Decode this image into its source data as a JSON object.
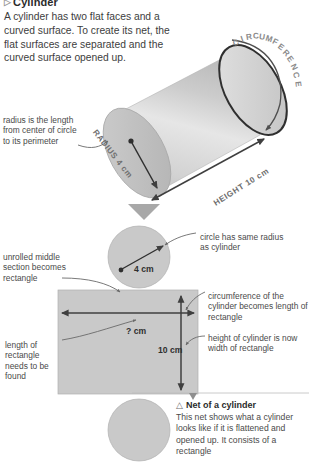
{
  "heading": {
    "marker": "▷",
    "title": "Cylinder"
  },
  "intro": "A cylinder has two flat faces and a curved surface. To create its net, the flat surfaces are separated and the curved surface opened up.",
  "diagram3d": {
    "circumference_label": "CIRCUMFERENCE",
    "radius_label": "RADIUS 4 cm",
    "height_label": "HEIGHT 10 cm"
  },
  "notes": {
    "radius": "radius is the length from center of circle to its perimeter",
    "circle_radius": "circle has same radius as cylinder",
    "unrolled": "unrolled middle section becomes rectangle",
    "circumference_length": "circumference of the cylinder becomes length of rectangle",
    "height_width": "height of cylinder is now width of rectangle",
    "length_unknown": "length of rectangle needs to be found"
  },
  "net": {
    "circle_radius_label": "4 cm",
    "rect_length_label": "? cm",
    "rect_width_label": "10 cm"
  },
  "caption": {
    "marker": "△",
    "title": "Net of a cylinder",
    "body": "This net shows what a cylinder looks like if it is flattened and opened up. It consists of a rectangle"
  },
  "colors": {
    "ink": "#3a3a3a",
    "cylinder_fill": "#cfcfcf",
    "cylinder_face": "#c8c8c8",
    "net_fill": "#c9c9c9",
    "arrow": "#4a4a4a",
    "chevron": "#9e9e9e"
  }
}
